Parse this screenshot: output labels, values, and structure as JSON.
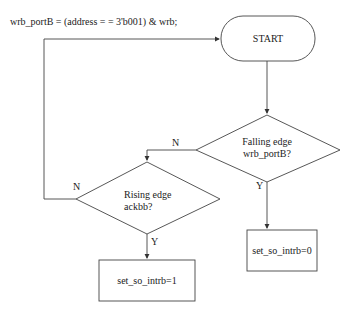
{
  "header": {
    "expression": "wrb_portB = (address = = 3'b001) & wrb;"
  },
  "nodes": {
    "start": {
      "label": "START",
      "shape": "terminator"
    },
    "decision_falling": {
      "line1": "Falling edge",
      "line2": "wrb_portB?",
      "shape": "diamond"
    },
    "decision_rising": {
      "line1": "Rising edge",
      "line2": "ackbb?",
      "shape": "diamond"
    },
    "process_set1": {
      "label": "set_so_intrb=1",
      "shape": "rectangle"
    },
    "process_set0": {
      "label": "set_so_intrb=0",
      "shape": "rectangle"
    }
  },
  "edges": {
    "falling_no": "N",
    "falling_yes": "Y",
    "rising_no": "N",
    "rising_yes": "Y"
  },
  "colors": {
    "stroke": "#333333",
    "background": "#ffffff"
  }
}
